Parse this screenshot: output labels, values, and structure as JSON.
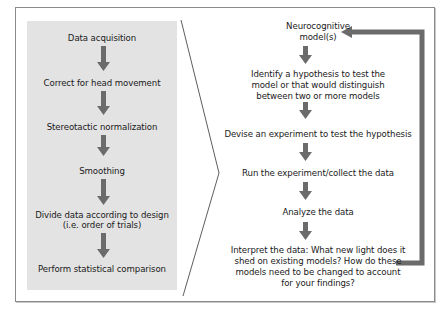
{
  "diagram": {
    "left_flow": {
      "title": "fMRI analysis pipeline",
      "steps": [
        {
          "label": "Data acquisition"
        },
        {
          "label": "Correct for head movement"
        },
        {
          "label": "Stereotactic normalization"
        },
        {
          "label": "Smoothing"
        },
        {
          "label": "Divide data according to design",
          "label2": "(i.e. order of trials)"
        },
        {
          "label": "Perform statistical comparison"
        }
      ]
    },
    "right_flow": {
      "steps": [
        {
          "lines": [
            "Neurocognitive",
            "model(s)"
          ]
        },
        {
          "lines": [
            "Identify a hypothesis to test the",
            "model or that would distinguish",
            "between two or more models"
          ]
        },
        {
          "lines": [
            "Devise an experiment to test the hypothesis"
          ]
        },
        {
          "lines": [
            "Run the experiment/collect the data"
          ]
        },
        {
          "lines": [
            "Analyze the data"
          ]
        },
        {
          "lines": [
            "Interpret the data: What new light does it",
            "shed on existing models? How do these",
            "models need to be changed to account",
            "for your findings?"
          ]
        }
      ],
      "feedback_loop": "from last step back to Neurocognitive model(s)"
    },
    "colors": {
      "panel_bg": "#e3e3e3",
      "arrow": "#6b6b6b",
      "frame_border": "#8a8a8a",
      "divider_line": "#333333"
    }
  }
}
